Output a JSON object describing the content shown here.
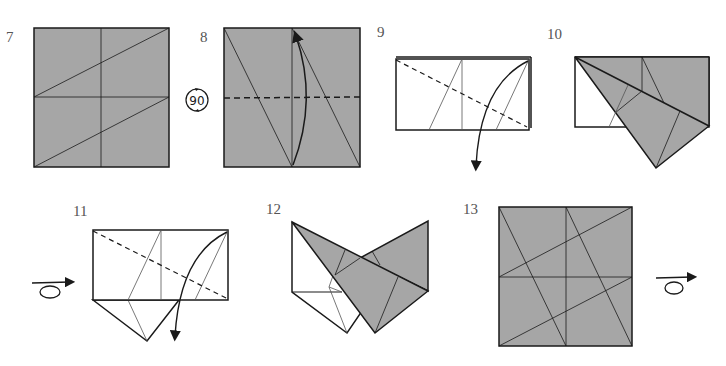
{
  "diagram": {
    "type": "origami-folding-instructions",
    "colors": {
      "paper_colored": "#a6a6a6",
      "paper_white": "#ffffff",
      "line": "#1a1a1a",
      "crease": "#555555",
      "step_number": "#555555"
    },
    "steps": [
      {
        "number": "7",
        "description": "Square with creases: horizontal and vertical midlines plus two parallel diagonals"
      },
      {
        "number": "8",
        "description": "Square rotated; valley fold along dashed horizontal line, arrow pointing up"
      },
      {
        "number": "9",
        "description": "Rectangle with dashed diagonal fold, arrow curving down"
      },
      {
        "number": "10",
        "description": "Flap folded down along diagonal"
      },
      {
        "number": "11",
        "description": "Turned over; dashed diagonal fold with arrow down"
      },
      {
        "number": "12",
        "description": "Two flaps folded forming V shape"
      },
      {
        "number": "13",
        "description": "Unfolded square showing all creases; turn over"
      }
    ],
    "symbols": {
      "rotate_label": "90",
      "rotate_icon": "rotate-90-icon",
      "turn_over_icon": "turn-over-icon"
    }
  }
}
